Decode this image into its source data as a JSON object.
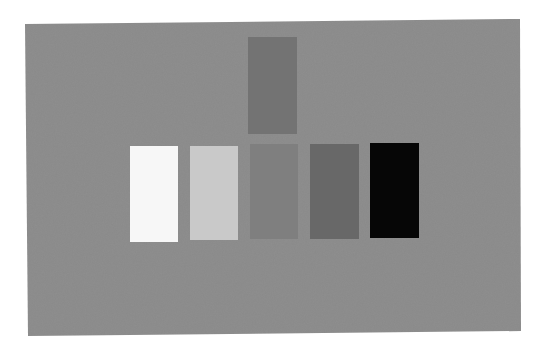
{
  "scene": {
    "description": "Grayscale reflectance patches on a mid-gray card",
    "background_color": "#ffffff",
    "card": {
      "color": "#8a8a8a",
      "points": "25,24 520,19 521,331 28,336"
    },
    "top_patch": {
      "label": "reference gray",
      "color": "#737373",
      "x": 248,
      "y": 37,
      "w": 49,
      "h": 97
    },
    "row_patches": [
      {
        "label": "white",
        "color": "#f7f7f7",
        "x": 130,
        "y": 146,
        "w": 48,
        "h": 96
      },
      {
        "label": "light gray",
        "color": "#c9c9c9",
        "x": 190,
        "y": 146,
        "w": 48,
        "h": 94
      },
      {
        "label": "mid gray",
        "color": "#7f7f7f",
        "x": 250,
        "y": 144,
        "w": 48,
        "h": 95
      },
      {
        "label": "dark gray",
        "color": "#686868",
        "x": 310,
        "y": 144,
        "w": 49,
        "h": 95
      },
      {
        "label": "black",
        "color": "#060606",
        "x": 370,
        "y": 143,
        "w": 49,
        "h": 95
      }
    ]
  }
}
